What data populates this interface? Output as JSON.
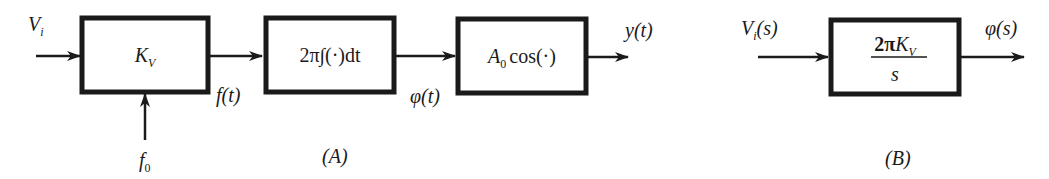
{
  "diagram_a": {
    "caption": "(A)",
    "input_label": {
      "base": "V",
      "sub": "i"
    },
    "side_input_label": {
      "base": "f",
      "sub": "0"
    },
    "blocks": [
      {
        "id": "vco-gain",
        "base": "K",
        "sub": "V"
      },
      {
        "id": "integrator",
        "text": "2π∫(·)dt"
      },
      {
        "id": "cosine",
        "base": "A",
        "sub": "0",
        "rest": "cos(·)"
      }
    ],
    "signals": {
      "f_t": "f(t)",
      "phi_t": "φ(t)",
      "y_t": "y(t)"
    }
  },
  "diagram_b": {
    "caption": "(B)",
    "input_label": {
      "base": "V",
      "sub": "i",
      "rest": "(s)"
    },
    "block": {
      "numerator_prefix": "2π",
      "numerator_base": "K",
      "numerator_sub": "V",
      "denominator": "s"
    },
    "output_label": "φ(s)"
  },
  "colors": {
    "stroke": "#1a1a1a",
    "background": "#ffffff"
  }
}
